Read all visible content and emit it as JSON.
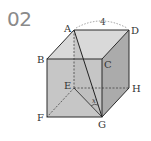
{
  "problem": {
    "number": "02"
  },
  "figure": {
    "type": "cube",
    "vertices": {
      "A": {
        "label": "A",
        "x": 74,
        "y": 30
      },
      "B": {
        "label": "B",
        "x": 47,
        "y": 59
      },
      "C": {
        "label": "C",
        "x": 102,
        "y": 59
      },
      "D": {
        "label": "D",
        "x": 129,
        "y": 30
      },
      "E": {
        "label": "E",
        "x": 74,
        "y": 88
      },
      "F": {
        "label": "F",
        "x": 47,
        "y": 117
      },
      "G": {
        "label": "G",
        "x": 102,
        "y": 117
      },
      "H": {
        "label": "H",
        "x": 129,
        "y": 88
      }
    },
    "edge_length_label": "4",
    "angle_label": "x",
    "colors": {
      "top_face": "#d6d6d6",
      "front_face": "#c4c4c4",
      "right_face": "#a9a9a9",
      "edge": "#2b2b2b",
      "hidden_edge": "#444444",
      "triangle_fill": "#b8b8b8"
    }
  }
}
